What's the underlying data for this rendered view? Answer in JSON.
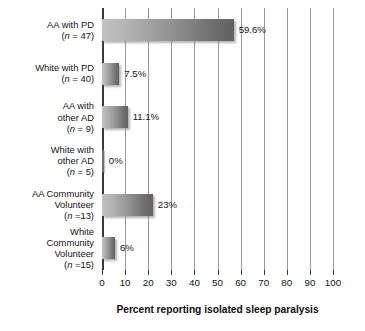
{
  "chart_data": {
    "type": "bar",
    "orientation": "horizontal",
    "title": "",
    "xlabel": "Percent reporting isolated sleep paralysis",
    "ylabel": "",
    "xlim": [
      0,
      100
    ],
    "xticks": [
      "0",
      "10",
      "20",
      "30",
      "40",
      "50",
      "60",
      "70",
      "80",
      "90",
      "100"
    ],
    "grid": "vertical",
    "legend": "none",
    "categories": [
      "AA with PD (n = 47)",
      "White with PD (n = 40)",
      "AA with other AD (n = 9)",
      "White with other AD (n = 5)",
      "AA Community Volunteer (n =13)",
      "White Community Volunteer (n =15)"
    ],
    "values": [
      59.6,
      7.5,
      11.1,
      0,
      23,
      6
    ],
    "value_labels": [
      "59.6%",
      "7.5%",
      "11.1%",
      "0%",
      "23%",
      "6%"
    ],
    "bars": [
      {
        "name": "AA with PD",
        "label_lines": [
          "AA with PD"
        ],
        "n_text": "(n = 47)",
        "n_value": 47,
        "value": 59.6,
        "value_label": "59.6%",
        "drawn_length": 57.0
      },
      {
        "name": "White with PD",
        "label_lines": [
          "White with PD"
        ],
        "n_text": "(n = 40)",
        "n_value": 40,
        "value": 7.5,
        "value_label": "7.5%",
        "drawn_length": 7.5
      },
      {
        "name": "AA with other AD",
        "label_lines": [
          "AA with",
          "other AD"
        ],
        "n_text": "(n = 9)",
        "n_value": 9,
        "value": 11.1,
        "value_label": "11.1%",
        "drawn_length": 11.1
      },
      {
        "name": "White with other AD",
        "label_lines": [
          "White with",
          "other AD"
        ],
        "n_text": "(n = 5)",
        "n_value": 5,
        "value": 0,
        "value_label": "0%",
        "drawn_length": 0.6
      },
      {
        "name": "AA Community Volunteer",
        "label_lines": [
          "AA Community",
          "Volunteer"
        ],
        "n_text": "(n =13)",
        "n_value": 13,
        "value": 23,
        "value_label": "23%",
        "drawn_length": 22.0
      },
      {
        "name": "White Community Volunteer",
        "label_lines": [
          "White",
          "Community",
          "Volunteer"
        ],
        "n_text": "(n =15)",
        "n_value": 15,
        "value": 6,
        "value_label": "6%",
        "drawn_length": 5.6
      }
    ],
    "colors": {
      "bar_gradient_start": "#c2c2c2",
      "bar_gradient_end": "#626262",
      "gridline": "#9a9a9a",
      "axis": "#3a3a3a",
      "text": "#141414",
      "background": "#ffffff"
    }
  }
}
